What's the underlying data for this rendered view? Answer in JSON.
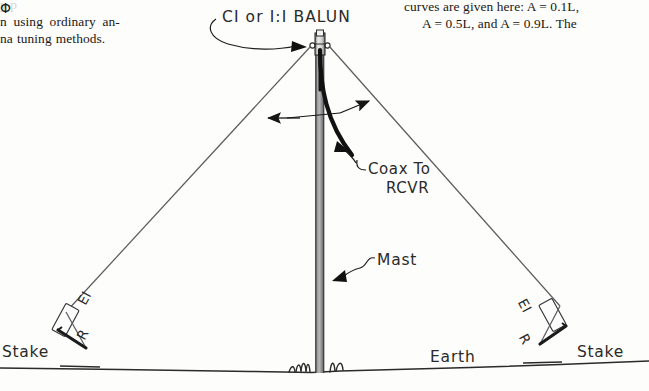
{
  "page": {
    "background_color": "#fdfdfb",
    "ink_color": "#1b1b1b",
    "wire_color": "#55565a",
    "mast_color": "#8a8a8c"
  },
  "text_columns": {
    "left": {
      "lines": [
        "y  p",
        "n using ordinary an-",
        "na tuning methods."
      ]
    },
    "right": {
      "lines": [
        "curves are given here: A = 0.1L,",
        "A = 0.5L, and A = 0.9L. The"
      ]
    }
  },
  "diagram": {
    "labels": {
      "balun": "CI or I:I BALUN",
      "coax_line1": "Coax To",
      "coax_line2": "RCVR",
      "mast": "Mast",
      "earth": "Earth",
      "stake_left": "Stake",
      "stake_right": "Stake",
      "insulator_left": "EI",
      "insulator_right": "EI",
      "rope_left": "R",
      "rope_right": "R",
      "apex_angle": "Φ"
    }
  }
}
